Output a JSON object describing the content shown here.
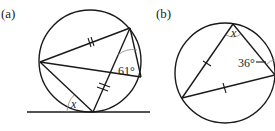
{
  "figure": {
    "panels": [
      {
        "label": "(a)",
        "angle_given": "61°",
        "angle_unknown": "x",
        "elements": [
          "circle",
          "tangent-line",
          "inscribed-quadrilateral-with-diagonal",
          "double-tick-equal-chords"
        ]
      },
      {
        "label": "(b)",
        "angle_given": "36°",
        "angle_unknown": "x",
        "elements": [
          "circle",
          "inscribed-isosceles-triangle",
          "single-tick-equal-sides"
        ]
      }
    ]
  }
}
